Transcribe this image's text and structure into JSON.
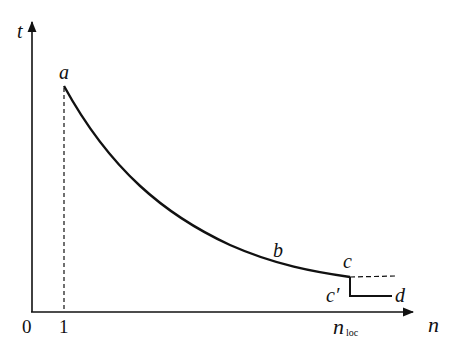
{
  "diagram": {
    "axes": {
      "y_label": "t",
      "x_label": "n",
      "origin_label": "0",
      "x_tick_label": "1",
      "x_marker_label": "n",
      "x_marker_subscript": "loc"
    },
    "points": {
      "a": "a",
      "b": "b",
      "c": "c",
      "c_prime": "c′",
      "d": "d"
    },
    "colors": {
      "ink": "#111111",
      "background": "#ffffff"
    }
  }
}
